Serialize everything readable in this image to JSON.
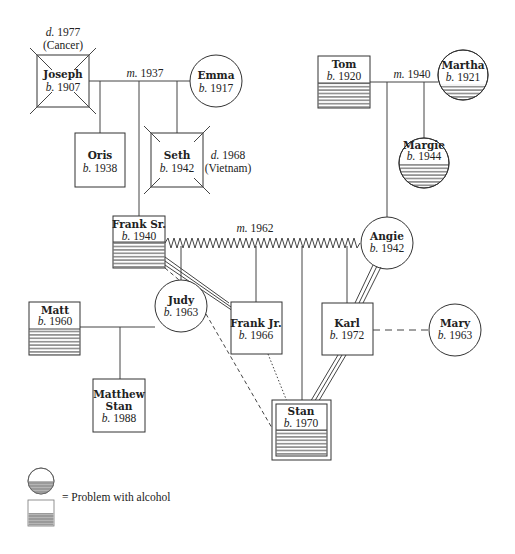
{
  "people": {
    "joseph": {
      "name": "Joseph",
      "born_prefix": "b.",
      "born": "1907",
      "death_prefix": "d.",
      "death": "1977",
      "cause": "(Cancer)",
      "sex": "male",
      "deceased": true,
      "alcohol": false
    },
    "emma": {
      "name": "Emma",
      "born_prefix": "b.",
      "born": "1917",
      "sex": "female",
      "alcohol": false
    },
    "oris": {
      "name": "Oris",
      "born_prefix": "b.",
      "born": "1938",
      "sex": "male",
      "alcohol": false
    },
    "seth": {
      "name": "Seth",
      "born_prefix": "b.",
      "born": "1942",
      "death_prefix": "d.",
      "death": "1968",
      "cause": "(Vietnam)",
      "sex": "male",
      "deceased": true,
      "alcohol": false
    },
    "tom": {
      "name": "Tom",
      "born_prefix": "b.",
      "born": "1920",
      "sex": "male",
      "alcohol": true
    },
    "martha": {
      "name": "Martha",
      "born_prefix": "b.",
      "born": "1921",
      "sex": "female",
      "alcohol": true
    },
    "margie": {
      "name": "Margie",
      "born_prefix": "b.",
      "born": "1944",
      "sex": "female",
      "alcohol": true
    },
    "frank_sr": {
      "name": "Frank Sr.",
      "born_prefix": "b.",
      "born": "1940",
      "sex": "male",
      "alcohol": true
    },
    "angie": {
      "name": "Angie",
      "born_prefix": "b.",
      "born": "1942",
      "sex": "female",
      "alcohol": false
    },
    "matt": {
      "name": "Matt",
      "born_prefix": "b.",
      "born": "1960",
      "sex": "male",
      "alcohol": true
    },
    "judy": {
      "name": "Judy",
      "born_prefix": "b.",
      "born": "1963",
      "sex": "female",
      "alcohol": false
    },
    "frank_jr": {
      "name": "Frank Jr.",
      "born_prefix": "b.",
      "born": "1966",
      "sex": "male",
      "alcohol": false
    },
    "karl": {
      "name": "Karl",
      "born_prefix": "b.",
      "born": "1972",
      "sex": "male",
      "alcohol": false
    },
    "mary": {
      "name": "Mary",
      "born_prefix": "b.",
      "born": "1963",
      "sex": "female",
      "alcohol": false
    },
    "matthew_stan": {
      "name_line1": "Matthew",
      "name_line2": "Stan",
      "born_prefix": "b.",
      "born": "1988",
      "sex": "male",
      "alcohol": false
    },
    "stan": {
      "name": "Stan",
      "born_prefix": "b.",
      "born": "1970",
      "sex": "male",
      "identified_patient": true,
      "alcohol": true
    }
  },
  "marriages": [
    {
      "between": [
        "Joseph",
        "Emma"
      ],
      "prefix": "m.",
      "year": "1937"
    },
    {
      "between": [
        "Tom",
        "Martha"
      ],
      "prefix": "m.",
      "year": "1940"
    },
    {
      "between": [
        "Frank Sr.",
        "Angie"
      ],
      "prefix": "m.",
      "year": "1962",
      "conflictual": true
    }
  ],
  "relationships": [
    {
      "between": [
        "Frank Sr.",
        "Frank Jr."
      ],
      "type": "very close (triple line)"
    },
    {
      "between": [
        "Angie",
        "Karl"
      ],
      "type": "very close (triple line)"
    },
    {
      "between": [
        "Karl",
        "Stan"
      ],
      "type": "very close (triple line)"
    },
    {
      "between": [
        "Frank Sr.",
        "Judy"
      ],
      "type": "distant (dashed)"
    },
    {
      "between": [
        "Frank Sr.",
        "Stan"
      ],
      "type": "distant (dashed)"
    },
    {
      "between": [
        "Frank Jr.",
        "Stan"
      ],
      "type": "distant (dotted)"
    },
    {
      "between": [
        "Karl",
        "Mary"
      ],
      "type": "unmarried relationship (dashed)"
    },
    {
      "between": [
        "Matt",
        "Judy"
      ],
      "type": "married"
    }
  ],
  "legend": {
    "text": "= Problem with alcohol",
    "symbols": [
      "circle-half-shaded",
      "square-half-shaded"
    ]
  },
  "colors": {
    "line": "#444444",
    "fill": "#ffffff",
    "hatch": "#333333",
    "legend_hatch": "#888888"
  }
}
